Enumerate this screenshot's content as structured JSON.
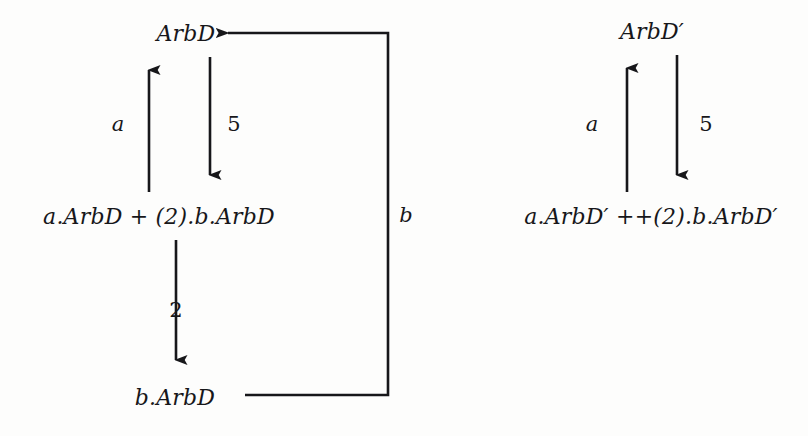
{
  "figure": {
    "type": "labelled-transition-system",
    "background_color": "#fdfdfc",
    "ink_color": "#17171a"
  },
  "diagrams": [
    {
      "id": "left",
      "name": "arbd-transition-graph",
      "nodes": [
        {
          "id": "arbd",
          "label": "ArbD",
          "x": 186,
          "y": 33
        },
        {
          "id": "sum",
          "label": "a.ArbD + (2).b.ArbD",
          "x": 159,
          "y": 216
        },
        {
          "id": "barbd",
          "label": "b.ArbD",
          "x": 175,
          "y": 397
        }
      ],
      "edges": [
        {
          "id": "sum-to-arbd",
          "label": "a",
          "from": "sum",
          "to": "arbd",
          "label_x": 118,
          "label_y": 124
        },
        {
          "id": "arbd-to-sum",
          "label": "5",
          "from": "arbd",
          "to": "sum",
          "label_x": 234,
          "label_y": 124
        },
        {
          "id": "sum-to-barbd",
          "label": "2",
          "from": "sum",
          "to": "barbd",
          "label_x": 176,
          "label_y": 310
        },
        {
          "id": "barbd-to-arbd",
          "label": "b",
          "from": "barbd",
          "to": "arbd",
          "label_x": 406,
          "label_y": 215
        }
      ]
    },
    {
      "id": "right",
      "name": "arbd-prime-transition-graph",
      "nodes": [
        {
          "id": "arbd-prime",
          "label": "ArbD′",
          "x": 652,
          "y": 31
        },
        {
          "id": "sum-prime",
          "label": "a.ArbD′ ++(2).b.ArbD′",
          "x": 651,
          "y": 216
        }
      ],
      "edges": [
        {
          "id": "sumprime-to-arbdprime",
          "label": "a",
          "from": "sum-prime",
          "to": "arbd-prime",
          "label_x": 592,
          "label_y": 124
        },
        {
          "id": "arbdprime-to-sumprime",
          "label": "5",
          "from": "arbd-prime",
          "to": "sum-prime",
          "label_x": 706,
          "label_y": 124
        }
      ]
    }
  ]
}
